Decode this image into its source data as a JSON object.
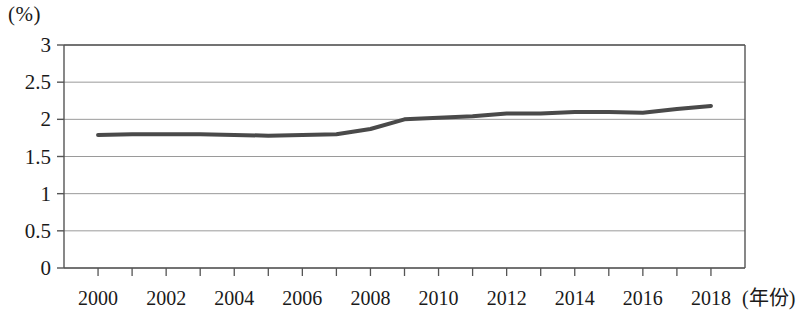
{
  "chart_data": {
    "type": "line",
    "title": "",
    "subtitle": "",
    "ylabel": "(%)",
    "xlabel": "(年份)",
    "x": [
      2000,
      2001,
      2002,
      2003,
      2004,
      2005,
      2006,
      2007,
      2008,
      2009,
      2010,
      2011,
      2012,
      2013,
      2014,
      2015,
      2016,
      2017,
      2018
    ],
    "categories": [
      "2000",
      "2001",
      "2002",
      "2003",
      "2004",
      "2005",
      "2006",
      "2007",
      "2008",
      "2009",
      "2010",
      "2011",
      "2012",
      "2013",
      "2014",
      "2015",
      "2016",
      "2017",
      "2018"
    ],
    "values": [
      1.79,
      1.8,
      1.8,
      1.8,
      1.79,
      1.78,
      1.79,
      1.8,
      1.87,
      2.0,
      2.02,
      2.04,
      2.08,
      2.08,
      2.1,
      2.1,
      2.09,
      2.14,
      2.18
    ],
    "series": [
      {
        "name": "",
        "color": "#4a4a4a",
        "values": [
          1.79,
          1.8,
          1.8,
          1.8,
          1.79,
          1.78,
          1.79,
          1.8,
          1.87,
          2.0,
          2.02,
          2.04,
          2.08,
          2.08,
          2.1,
          2.1,
          2.09,
          2.14,
          2.18
        ]
      }
    ],
    "ylim": [
      0,
      3
    ],
    "xlim": [
      1999,
      2019
    ],
    "yticks": [
      0,
      0.5,
      1,
      1.5,
      2,
      2.5,
      3
    ],
    "ytick_labels": [
      "0",
      "0.5",
      "1",
      "1.5",
      "2",
      "2.5",
      "3"
    ],
    "xticks": [
      2000,
      2002,
      2004,
      2006,
      2008,
      2010,
      2012,
      2014,
      2016,
      2018
    ],
    "xtick_labels": [
      "2000",
      "2002",
      "2004",
      "2006",
      "2008",
      "2010",
      "2012",
      "2014",
      "2016",
      "2018"
    ],
    "grid": true,
    "grid_axis": "y",
    "grid_color": "#9a9a9a",
    "legend": false,
    "legend_position": "none",
    "frame_color": "#555555",
    "line_width": 4
  },
  "axis": {
    "y_unit_label": "(%)",
    "x_axis_title": "(年份)"
  }
}
